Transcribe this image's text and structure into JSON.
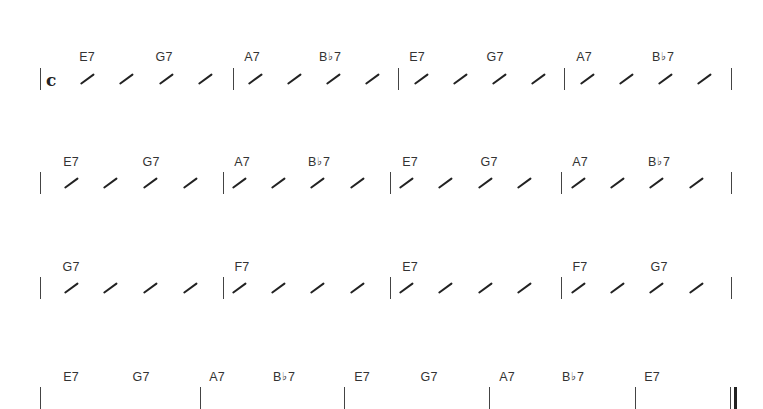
{
  "score": {
    "time_signature": "c",
    "flat_symbol": "♭",
    "systems": [
      {
        "chord_y": 50,
        "staff_y": 76,
        "barlines": [
          40,
          233,
          398,
          564,
          731
        ],
        "final": false,
        "measures": [
          {
            "chords": [
              {
                "root": "E",
                "flat": false,
                "quality": "7",
                "x": 87
              },
              {
                "root": "G",
                "flat": false,
                "quality": "7",
                "x": 164
              }
            ]
          },
          {
            "chords": [
              {
                "root": "A",
                "flat": false,
                "quality": "7",
                "x": 252
              },
              {
                "root": "B",
                "flat": true,
                "quality": "7",
                "x": 330
              }
            ]
          },
          {
            "chords": [
              {
                "root": "E",
                "flat": false,
                "quality": "7",
                "x": 417
              },
              {
                "root": "G",
                "flat": false,
                "quality": "7",
                "x": 495
              }
            ]
          },
          {
            "chords": [
              {
                "root": "A",
                "flat": false,
                "quality": "7",
                "x": 584
              },
              {
                "root": "B",
                "flat": true,
                "quality": "7",
                "x": 663
              }
            ]
          }
        ]
      },
      {
        "chord_y": 155,
        "staff_y": 180,
        "barlines": [
          40,
          223,
          390,
          561,
          731
        ],
        "final": false,
        "measures": [
          {
            "chords": [
              {
                "root": "E",
                "flat": false,
                "quality": "7",
                "x": 71
              },
              {
                "root": "G",
                "flat": false,
                "quality": "7",
                "x": 151
              }
            ]
          },
          {
            "chords": [
              {
                "root": "A",
                "flat": false,
                "quality": "7",
                "x": 242
              },
              {
                "root": "B",
                "flat": true,
                "quality": "7",
                "x": 319
              }
            ]
          },
          {
            "chords": [
              {
                "root": "E",
                "flat": false,
                "quality": "7",
                "x": 410
              },
              {
                "root": "G",
                "flat": false,
                "quality": "7",
                "x": 489
              }
            ]
          },
          {
            "chords": [
              {
                "root": "A",
                "flat": false,
                "quality": "7",
                "x": 580
              },
              {
                "root": "B",
                "flat": true,
                "quality": "7",
                "x": 659
              }
            ]
          }
        ]
      },
      {
        "chord_y": 260,
        "staff_y": 285,
        "barlines": [
          40,
          223,
          390,
          561,
          731
        ],
        "final": false,
        "measures": [
          {
            "chords": [
              {
                "root": "G",
                "flat": false,
                "quality": "7",
                "x": 71
              }
            ]
          },
          {
            "chords": [
              {
                "root": "F",
                "flat": false,
                "quality": "7",
                "x": 242
              }
            ]
          },
          {
            "chords": [
              {
                "root": "E",
                "flat": false,
                "quality": "7",
                "x": 410
              }
            ]
          },
          {
            "chords": [
              {
                "root": "F",
                "flat": false,
                "quality": "7",
                "x": 580
              },
              {
                "root": "G",
                "flat": false,
                "quality": "7",
                "x": 659
              }
            ]
          }
        ]
      },
      {
        "chord_y": 370,
        "staff_y": 395,
        "barlines": [
          40,
          200,
          344,
          489,
          635,
          730
        ],
        "final": true,
        "measures": [
          {
            "chords": [
              {
                "root": "E",
                "flat": false,
                "quality": "7",
                "x": 71
              },
              {
                "root": "G",
                "flat": false,
                "quality": "7",
                "x": 141
              }
            ]
          },
          {
            "chords": [
              {
                "root": "A",
                "flat": false,
                "quality": "7",
                "x": 217
              },
              {
                "root": "B",
                "flat": true,
                "quality": "7",
                "x": 284
              }
            ]
          },
          {
            "chords": [
              {
                "root": "E",
                "flat": false,
                "quality": "7",
                "x": 362
              },
              {
                "root": "G",
                "flat": false,
                "quality": "7",
                "x": 429
              }
            ]
          },
          {
            "chords": [
              {
                "root": "A",
                "flat": false,
                "quality": "7",
                "x": 507
              },
              {
                "root": "B",
                "flat": true,
                "quality": "7",
                "x": 573
              }
            ]
          },
          {
            "chords": [
              {
                "root": "E",
                "flat": false,
                "quality": "7",
                "x": 652
              }
            ]
          }
        ]
      }
    ],
    "slash_rows": [
      {
        "system": 0,
        "xs": [
          87,
          126,
          166,
          205,
          255,
          294,
          333,
          372,
          421,
          460,
          499,
          538,
          587,
          626,
          665,
          704
        ]
      },
      {
        "system": 1,
        "xs": [
          71,
          110,
          150,
          190,
          239,
          278,
          317,
          357,
          406,
          445,
          485,
          524,
          578,
          617,
          656,
          696
        ]
      },
      {
        "system": 2,
        "xs": [
          71,
          110,
          150,
          190,
          239,
          278,
          317,
          357,
          406,
          445,
          485,
          524,
          578,
          617,
          656,
          696
        ]
      }
    ]
  }
}
